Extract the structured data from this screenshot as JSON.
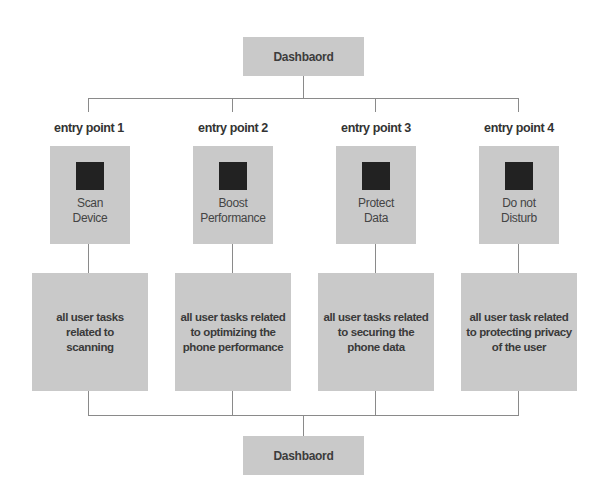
{
  "diagram": {
    "top_node": {
      "label": "Dashbaord"
    },
    "bottom_node": {
      "label": "Dashbaord"
    },
    "columns": [
      {
        "entry_label": "entry point 1",
        "feature": {
          "icon": "square-icon",
          "line1": "Scan",
          "line2": "Device"
        },
        "description": "all user tasks related to scanning"
      },
      {
        "entry_label": "entry point 2",
        "feature": {
          "icon": "square-icon",
          "line1": "Boost",
          "line2": "Performance"
        },
        "description": "all user tasks related to optimizing the phone performance"
      },
      {
        "entry_label": "entry point 3",
        "feature": {
          "icon": "square-icon",
          "line1": "Protect",
          "line2": "Data"
        },
        "description": "all user tasks related to securing the phone data"
      },
      {
        "entry_label": "entry point 4",
        "feature": {
          "icon": "square-icon",
          "line1": "Do not",
          "line2": "Disturb"
        },
        "description": "all user task related to protecting privacy of the user"
      }
    ],
    "colors": {
      "box_fill": "#c9c9c9",
      "icon_fill": "#222222",
      "connector": "#8a8a8a",
      "background": "#ffffff"
    }
  }
}
